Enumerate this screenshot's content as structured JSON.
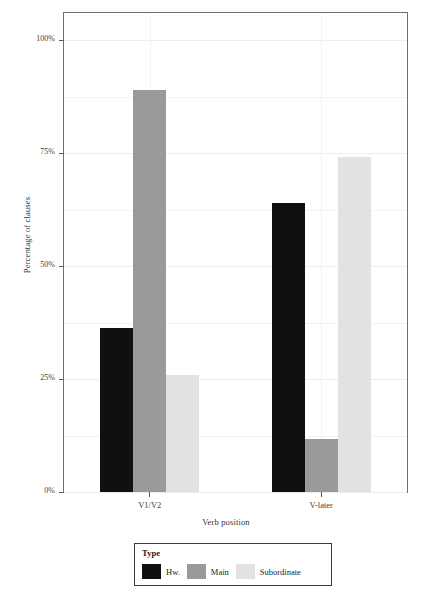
{
  "chart_data": {
    "type": "bar",
    "title": "",
    "subtitle": "",
    "xlabel": "Verb position",
    "ylabel": "Percentage of clauses",
    "categories": [
      "V1/V2",
      "V-later"
    ],
    "series": [
      {
        "name": "Hw.",
        "values": [
          36.2,
          64.0
        ],
        "color": "#101010"
      },
      {
        "name": "Main",
        "values": [
          88.9,
          11.8
        ],
        "color": "#9a9a9a"
      },
      {
        "name": "Subordinate",
        "values": [
          26.0,
          74.2
        ],
        "color": "#e2e2e2"
      }
    ],
    "ylim": [
      0,
      106
    ],
    "ytick_values": [
      0,
      25,
      50,
      75,
      100
    ],
    "ytick_labels": [
      "0%",
      "25%",
      "50%",
      "75%",
      "100%"
    ],
    "yminor_values": [
      12.5,
      37.5,
      62.5,
      87.5
    ],
    "grid": true,
    "legend": {
      "title": "Type",
      "position": "bottom",
      "entries": [
        "Hw.",
        "Main",
        "Subordinate"
      ]
    }
  },
  "axes": {
    "y_title": "Percentage of clauses",
    "x_title": "Verb position"
  },
  "legend": {
    "title": "Type",
    "items": [
      {
        "label": "Hw.",
        "color": "#101010"
      },
      {
        "label": "Main",
        "color": "#9a9a9a"
      },
      {
        "label": "Subordinate",
        "color": "#e2e2e2"
      }
    ]
  },
  "colors": {
    "panel_border": "#707070",
    "gridline": "#f2f2f2",
    "tick": "#5a5a5a",
    "text": "#333333",
    "background": "#ffffff"
  }
}
